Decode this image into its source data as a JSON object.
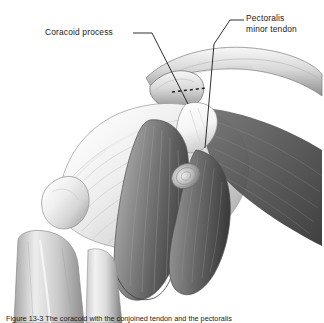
{
  "figure": {
    "background_color": "#ffffff",
    "ink_color": "#1a1a1a",
    "labels": [
      {
        "id": "coracoid",
        "text": "Coracoid process",
        "lines": [
          "Coracoid process"
        ]
      },
      {
        "id": "pectoralis",
        "text": "Pectoralis minor tendon",
        "lines": [
          "Pectoralis",
          "minor tendon"
        ]
      }
    ],
    "caption": {
      "figure_number": "Figure 13-3",
      "text": "Figure 13-3  The coracoid with the conjoined tendon and the pectoralis",
      "clipped": true
    },
    "leader_lines": [
      {
        "for": "coracoid",
        "from": [
          133,
          33
        ],
        "to": [
          186,
          103
        ]
      },
      {
        "for": "pectoralis",
        "from": [
          243,
          20
        ],
        "to": [
          214,
          44
        ]
      }
    ]
  }
}
